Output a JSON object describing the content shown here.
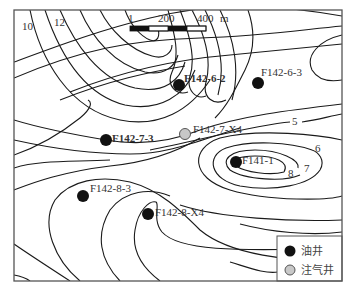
{
  "map": {
    "frame": {
      "x": 14,
      "y": 10,
      "width": 328,
      "height": 271
    },
    "scale_bar": {
      "labels": [
        "1",
        "200",
        "400",
        "m"
      ],
      "x": 130,
      "y": 26,
      "width": 112
    },
    "contour_labels": [
      {
        "text": "10",
        "x": 22,
        "y": 30
      },
      {
        "text": "12",
        "x": 54,
        "y": 26
      },
      {
        "text": "5",
        "x": 296,
        "y": 125
      },
      {
        "text": "6",
        "x": 315,
        "y": 152
      },
      {
        "text": "7",
        "x": 304,
        "y": 172
      },
      {
        "text": "8",
        "x": 288,
        "y": 176
      }
    ],
    "wells": [
      {
        "id": "F142-6-2",
        "type": "oil",
        "x": 179,
        "y": 85,
        "label_x": 184,
        "label_y": 81
      },
      {
        "id": "F142-6-3",
        "type": "oil",
        "x": 258,
        "y": 83,
        "label_x": 262,
        "label_y": 75
      },
      {
        "id": "F142-7-3",
        "type": "oil",
        "x": 106,
        "y": 140,
        "label_x": 112,
        "label_y": 141
      },
      {
        "id": "F142-7-X4",
        "type": "gas",
        "x": 185,
        "y": 134,
        "label_x": 193,
        "label_y": 131
      },
      {
        "id": "F141-1",
        "type": "oil",
        "x": 236,
        "y": 162,
        "label_x": 242,
        "label_y": 164
      },
      {
        "id": "F142-8-3",
        "type": "oil",
        "x": 83,
        "y": 196,
        "label_x": 90,
        "label_y": 191
      },
      {
        "id": "F142-8-X4",
        "type": "oil",
        "x": 148,
        "y": 214,
        "label_x": 155,
        "label_y": 215
      }
    ],
    "colors": {
      "oil_well": "#111111",
      "gas_well_fill": "#c8c8c8",
      "gas_well_stroke": "#555555",
      "contour": "#1a1a1a"
    }
  },
  "legend": {
    "items": [
      {
        "label": "油井",
        "type": "oil"
      },
      {
        "label": "注气井",
        "type": "gas"
      }
    ]
  }
}
